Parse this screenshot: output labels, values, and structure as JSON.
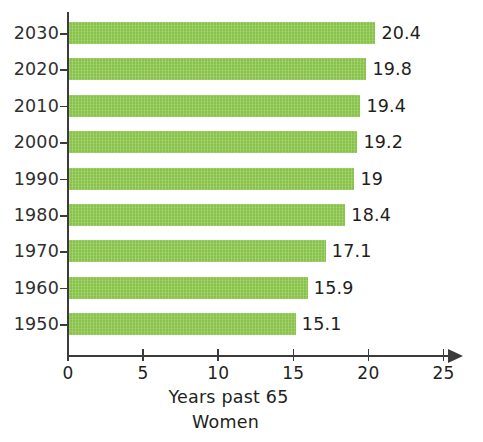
{
  "chart_data": {
    "type": "bar",
    "orientation": "horizontal",
    "title": "",
    "xlabel": "Years past 65",
    "sublabel": "Women",
    "ylabel": "",
    "categories": [
      "2030",
      "2020",
      "2010",
      "2000",
      "1990",
      "1980",
      "1970",
      "1960",
      "1950"
    ],
    "values": [
      20.4,
      19.8,
      19.4,
      19.2,
      19,
      18.4,
      17.1,
      15.9,
      15.1
    ],
    "value_labels": [
      "20.4",
      "19.8",
      "19.4",
      "19.2",
      "19",
      "18.4",
      "17.1",
      "15.9",
      "15.1"
    ],
    "xlim": [
      0,
      25
    ],
    "xticks": [
      0,
      5,
      10,
      15,
      20,
      25
    ],
    "xtick_labels": [
      "0",
      "5",
      "10",
      "15",
      "20",
      "25"
    ],
    "grid": false,
    "legend": false,
    "bar_color": "#8ec94e",
    "axis_color": "#3b3b3b",
    "text_color": "#231f20",
    "background": "#ffffff"
  },
  "axis": {
    "x_title": "Years past 65",
    "x_subtitle": "Women"
  }
}
